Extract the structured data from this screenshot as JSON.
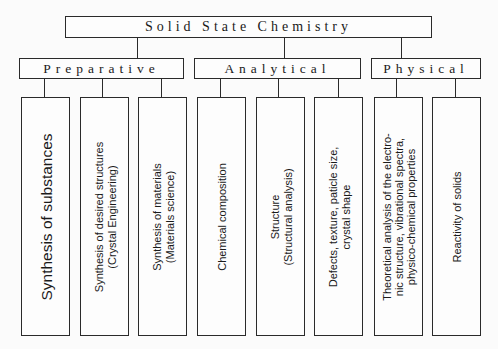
{
  "diagram": {
    "root": {
      "label": "Solid State Chemistry"
    },
    "categories": [
      {
        "label": "Preparative"
      },
      {
        "label": "Analytical"
      },
      {
        "label": "Physical"
      }
    ],
    "leaves": [
      {
        "category": "Preparative",
        "line1": "Synthesis of substances",
        "line2": "",
        "line3": ""
      },
      {
        "category": "Preparative",
        "line1": "Synthesis of desired structures",
        "line2": "(Crystal Engineering)",
        "line3": ""
      },
      {
        "category": "Preparative",
        "line1": "Synthesis of materials",
        "line2": "(Materials science)",
        "line3": ""
      },
      {
        "category": "Analytical",
        "line1": "Chemical composition",
        "line2": "",
        "line3": ""
      },
      {
        "category": "Analytical",
        "line1": "Structure",
        "line2": "(Structural analysis)",
        "line3": ""
      },
      {
        "category": "Analytical",
        "line1": "Defects, texture, paticle size,",
        "line2": "crystal shape",
        "line3": ""
      },
      {
        "category": "Physical",
        "line1": "Theoretical analysis of the electro-",
        "line2": "nic structure, vibrational spectra,",
        "line3": "physico-chemical properties"
      },
      {
        "category": "Physical",
        "line1": "Reactivity of solids",
        "line2": "",
        "line3": ""
      }
    ]
  }
}
